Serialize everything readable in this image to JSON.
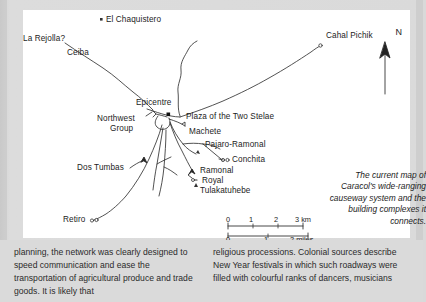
{
  "map": {
    "title_caption": [
      "The current map of",
      "Caracol's wide-ranging",
      "causeway system and the",
      "building complexes it",
      "connects."
    ],
    "compass": {
      "label": "N"
    },
    "site_labels": [
      {
        "id": "la-rejolla",
        "text": "La Rejolla?"
      },
      {
        "id": "el-chaquistero",
        "text": "El Chaquistero"
      },
      {
        "id": "cahal-pichik",
        "text": "Cahal Pichik"
      },
      {
        "id": "ceiba",
        "text": "Ceiba"
      },
      {
        "id": "epicentre",
        "text": "Epicentre"
      },
      {
        "id": "plaza-two-stelae",
        "text": "Plaza of the Two Stelae"
      },
      {
        "id": "northwest-group-1",
        "text": "Northwest"
      },
      {
        "id": "northwest-group-2",
        "text": "Group"
      },
      {
        "id": "machete",
        "text": "Machete"
      },
      {
        "id": "pajaro-ramonal",
        "text": "Pajaro-Ramonal"
      },
      {
        "id": "conchita",
        "text": "Conchita"
      },
      {
        "id": "dos-tumbas",
        "text": "Dos Tumbas"
      },
      {
        "id": "ramonal",
        "text": "Ramonal"
      },
      {
        "id": "royal",
        "text": "Royal"
      },
      {
        "id": "tulakatuhebe",
        "text": "Tulakatuhebe"
      },
      {
        "id": "retiro",
        "text": "Retiro"
      }
    ],
    "scale": {
      "km_ticks": [
        "0",
        "1",
        "2",
        "3 km"
      ],
      "mile_ticks": [
        "0",
        "1",
        "2 miles"
      ]
    }
  },
  "body_text": {
    "left_column": "planning, the network was clearly designed to speed communication and ease the transportation of agricultural produce and trade goods. It is likely that",
    "right_column": "religious processions. Colonial sources describe New Year festivals in which such roadways were filled with colourful ranks of dancers, musicians"
  },
  "colors": {
    "page_background": "#dadada",
    "panel_background": "#ffffff",
    "ink": "#1c1c1c"
  }
}
